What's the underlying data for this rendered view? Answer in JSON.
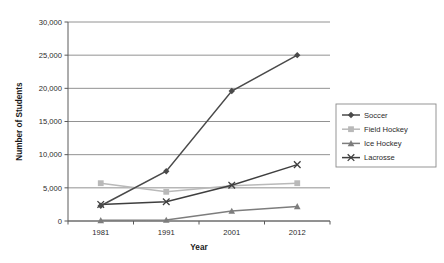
{
  "chart_data": {
    "type": "line",
    "title": "",
    "xlabel": "Year",
    "ylabel": "Number of Students",
    "categories": [
      "1981",
      "1991",
      "2001",
      "2012"
    ],
    "x": [
      1981,
      1991,
      2001,
      2012
    ],
    "ylim": [
      0,
      30000
    ],
    "yticks": [
      0,
      5000,
      10000,
      15000,
      20000,
      25000,
      30000
    ],
    "ytick_labels": [
      "0",
      "5,000",
      "10,000",
      "15,000",
      "20,000",
      "25,000",
      "30,000"
    ],
    "grid": "horizontal",
    "legend_position": "right",
    "series": [
      {
        "name": "Soccer",
        "marker": "diamond",
        "color": "#4a4a4a",
        "values": [
          2300,
          7500,
          19600,
          25000
        ]
      },
      {
        "name": "Field Hockey",
        "marker": "square",
        "color": "#b9b9b9",
        "values": [
          5700,
          4400,
          5300,
          5700
        ]
      },
      {
        "name": "Ice Hockey",
        "marker": "triangle",
        "color": "#7d7d7d",
        "values": [
          100,
          150,
          1500,
          2200
        ]
      },
      {
        "name": "Lacrosse",
        "marker": "cross",
        "color": "#3f3f3f",
        "values": [
          2500,
          2900,
          5400,
          8500
        ]
      }
    ]
  },
  "legend": {
    "items": [
      {
        "label": "Soccer"
      },
      {
        "label": "Field Hockey"
      },
      {
        "label": "Ice Hockey"
      },
      {
        "label": "Lacrosse"
      }
    ]
  }
}
